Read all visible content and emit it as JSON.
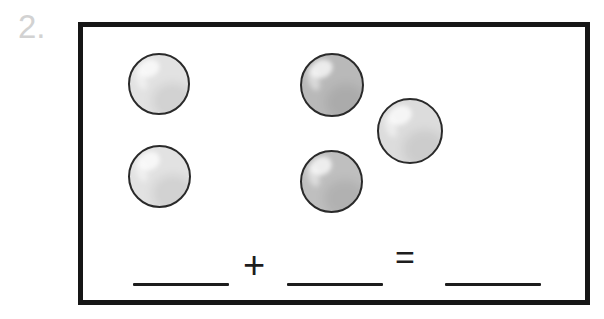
{
  "page": {
    "background_color": "#ffffff",
    "problem_number": "2."
  },
  "problem_box": {
    "border_color": "#161616",
    "fill_color": "#ffffff",
    "frame": {
      "x": 78,
      "y": 22,
      "width": 512,
      "height": 283,
      "border_width": 5
    }
  },
  "counters": {
    "total_count": 5,
    "light_count": 3,
    "dark_count": 2,
    "light_fill": "#e2e2e2",
    "dark_fill": "#b9b9b9",
    "outline_color": "#2a2a2a",
    "items": [
      {
        "name": "counter-top-left",
        "group": "light",
        "fill": "#e2e2e2",
        "x": 45,
        "y": 26,
        "size": 62
      },
      {
        "name": "counter-top-middle",
        "group": "dark",
        "fill": "#b9b9b9",
        "x": 217,
        "y": 26,
        "size": 64
      },
      {
        "name": "counter-middle-right",
        "group": "light",
        "fill": "#dcdcdc",
        "x": 294,
        "y": 71,
        "size": 66
      },
      {
        "name": "counter-bottom-left",
        "group": "light",
        "fill": "#e2e2e2",
        "x": 45,
        "y": 118,
        "size": 63
      },
      {
        "name": "counter-bottom-middle",
        "group": "dark",
        "fill": "#bfbfbf",
        "x": 217,
        "y": 123,
        "size": 63
      }
    ]
  },
  "equation": {
    "blank_1": {
      "label": "",
      "x": 50,
      "width": 96
    },
    "plus": {
      "symbol": "+",
      "x": 160
    },
    "blank_2": {
      "label": "",
      "x": 204,
      "width": 96
    },
    "equals": {
      "symbol": "=",
      "x": 312
    },
    "blank_3": {
      "label": "",
      "x": 362,
      "width": 96
    },
    "line_color": "#1d1d1d"
  }
}
